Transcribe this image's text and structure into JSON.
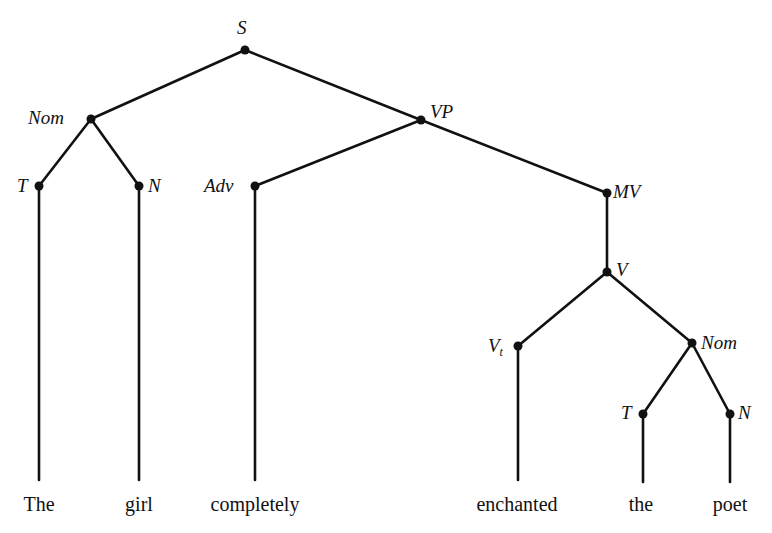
{
  "diagram": {
    "type": "syntax-tree",
    "nodes": {
      "S": "S",
      "Nom": "Nom",
      "VP": "VP",
      "T": "T",
      "N": "N",
      "Adv": "Adv",
      "MV": "MV",
      "V": "V",
      "Vt": "V",
      "Vt_sub": "t",
      "Nom2": "Nom",
      "T2": "T",
      "N2": "N"
    },
    "edges": [
      [
        "S",
        "Nom"
      ],
      [
        "S",
        "VP"
      ],
      [
        "Nom",
        "T"
      ],
      [
        "Nom",
        "N"
      ],
      [
        "VP",
        "Adv"
      ],
      [
        "VP",
        "MV"
      ],
      [
        "MV",
        "V"
      ],
      [
        "V",
        "Vt"
      ],
      [
        "V",
        "Nom2"
      ],
      [
        "Nom2",
        "T2"
      ],
      [
        "Nom2",
        "N2"
      ]
    ],
    "words": [
      "The",
      "girl",
      "completely",
      "enchanted",
      "the",
      "poet"
    ]
  }
}
